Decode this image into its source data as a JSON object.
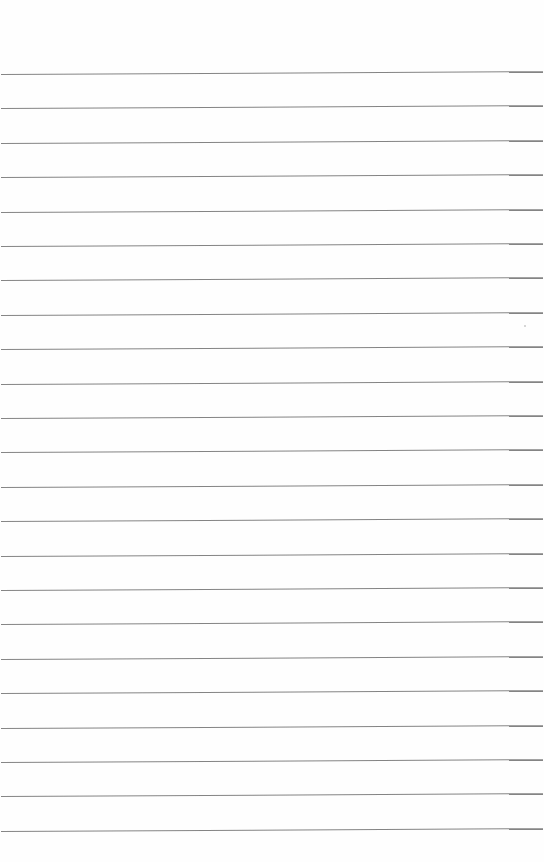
{
  "page": {
    "type": "lined-paper",
    "background_color": "#fefefe",
    "rule_color": "#6e6e6e",
    "rule_count": 23,
    "first_rule_y": 74,
    "rule_spacing": 34.4
  },
  "marks": [
    {
      "x": 524,
      "y": 325
    }
  ]
}
